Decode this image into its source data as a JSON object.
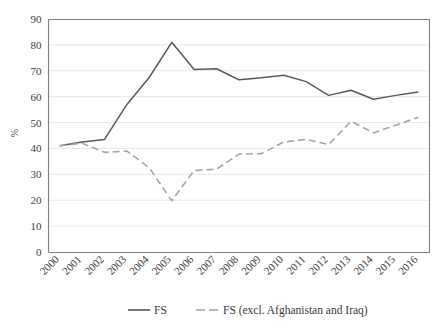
{
  "chart_data": {
    "type": "line",
    "title": "",
    "xlabel": "",
    "ylabel": "%",
    "ylim": [
      0,
      90
    ],
    "ytick_step": 10,
    "yticks": [
      "0",
      "10",
      "20",
      "30",
      "40",
      "50",
      "60",
      "70",
      "80",
      "90"
    ],
    "grid": true,
    "grid_axis": "y",
    "legend_position": "bottom",
    "categories": [
      "2000",
      "2001",
      "2002",
      "2003",
      "2004",
      "2005",
      "2006",
      "2007",
      "2008",
      "2009",
      "2010",
      "2011",
      "2012",
      "2013",
      "2014",
      "2015",
      "2016"
    ],
    "series": [
      {
        "name": "FS",
        "style": "solid",
        "color": "#595959",
        "values": [
          41.0,
          42.5,
          43.5,
          57.0,
          67.5,
          81.0,
          70.5,
          70.8,
          66.5,
          67.3,
          68.3,
          65.8,
          60.5,
          62.5,
          59.0,
          60.5,
          61.8
        ]
      },
      {
        "name": "FS (excl. Afghanistan and Iraq)",
        "style": "dashed",
        "color": "#a6a6a6",
        "values": [
          41.0,
          42.0,
          38.5,
          39.0,
          32.5,
          19.8,
          31.5,
          32.0,
          37.8,
          38.0,
          42.5,
          43.5,
          41.5,
          50.5,
          46.0,
          49.0,
          52.0
        ]
      }
    ]
  },
  "legend": {
    "items": [
      {
        "label": "FS",
        "style": "solid",
        "color": "#595959"
      },
      {
        "label": "FS (excl. Afghanistan and Iraq)",
        "style": "dashed",
        "color": "#a6a6a6"
      }
    ]
  },
  "axes": {
    "y_title": "%",
    "plot_border_color": "#7f7f7f",
    "gridline_color": "#e8e8e8"
  }
}
